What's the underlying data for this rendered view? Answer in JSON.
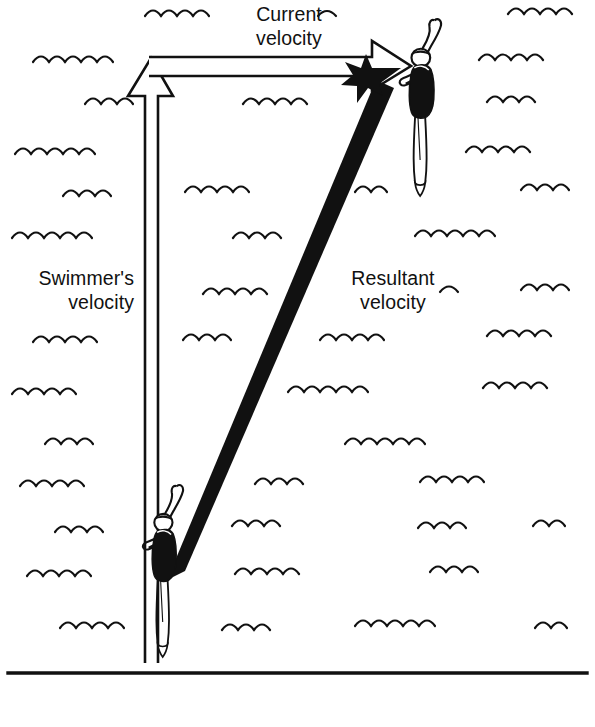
{
  "diagram": {
    "background_color": "#ffffff",
    "ink_color": "#111111",
    "labels": {
      "current_velocity": "Current\nvelocity",
      "swimmer_velocity": "Swimmer's\nvelocity",
      "resultant_velocity": "Resultant\nvelocity"
    },
    "vectors": [
      {
        "name": "swimmer-velocity-vector",
        "label": "Swimmer's velocity",
        "style": "hollow-outline",
        "direction": "up",
        "from": [
          151,
          660
        ],
        "to": [
          151,
          58
        ]
      },
      {
        "name": "current-velocity-vector",
        "label": "Current velocity",
        "style": "hollow-outline",
        "direction": "right",
        "from": [
          151,
          66
        ],
        "to": [
          410,
          66
        ]
      },
      {
        "name": "resultant-velocity-vector",
        "label": "Resultant velocity",
        "style": "solid-black",
        "direction": "up-right",
        "from": [
          176,
          576
        ],
        "to": [
          401,
          72
        ]
      }
    ],
    "figures": [
      {
        "name": "swimmer-figure-start",
        "position": [
          172,
          487
        ],
        "description": "swimmer standing, one arm raised"
      },
      {
        "name": "swimmer-figure-end",
        "position": [
          432,
          20
        ],
        "description": "swimmer standing, one arm raised"
      }
    ],
    "riverbank_line_y": 673,
    "water_waves_count": 44
  }
}
